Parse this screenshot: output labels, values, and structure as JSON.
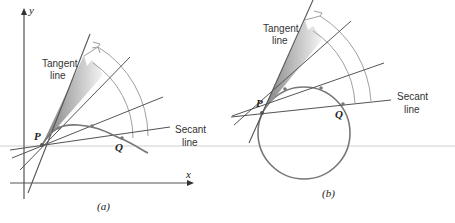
{
  "panels": [
    {
      "id": "a",
      "caption": "(a)",
      "axes": {
        "x_label": "x",
        "y_label": "y"
      },
      "labels": {
        "tangent": [
          "Tangent",
          "line"
        ],
        "secant": [
          "Secant",
          "line"
        ],
        "point_p": "P",
        "point_q": "Q"
      },
      "curve": "smooth curve"
    },
    {
      "id": "b",
      "caption": "(b)",
      "labels": {
        "tangent": [
          "Tangent",
          "line"
        ],
        "secant": [
          "Secant",
          "line"
        ],
        "point_p": "P",
        "point_q": "Q"
      },
      "curve": "circle"
    }
  ],
  "colors": {
    "line": "#555555",
    "arc": "#9a9a9a",
    "shade_dark": "#8a8a8a",
    "shade_light": "#f2f2f2",
    "rule": "#c8c8c8"
  }
}
